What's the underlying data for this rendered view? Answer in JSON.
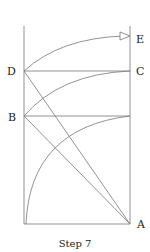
{
  "labels": {
    "D": "D",
    "B": "B",
    "C": "C",
    "E": "E",
    "A": "A"
  },
  "caption": "Step 7",
  "colors": {
    "line": "#777777",
    "text": "#222222"
  }
}
